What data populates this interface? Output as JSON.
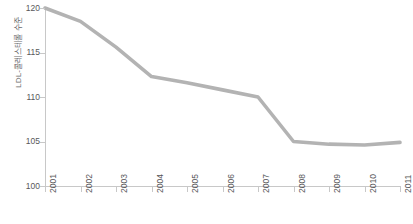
{
  "chart_data": {
    "type": "line",
    "title": "",
    "xlabel": "",
    "ylabel": "LDL-콜레스테롤 수준",
    "categories": [
      "2001",
      "2002",
      "2003",
      "2004",
      "2005",
      "2006",
      "2007",
      "2008",
      "2009",
      "2010",
      "2011"
    ],
    "values": [
      120.0,
      118.5,
      115.6,
      112.3,
      111.6,
      110.8,
      110.0,
      105.0,
      104.7,
      104.6,
      104.9
    ],
    "series": [
      {
        "name": "LDL-콜레스테롤 수준",
        "values": [
          120.0,
          118.5,
          115.6,
          112.3,
          111.6,
          110.8,
          110.0,
          105.0,
          104.7,
          104.6,
          104.9
        ]
      }
    ],
    "ylim": [
      100,
      120
    ],
    "y_ticks": [
      100,
      105,
      110,
      115,
      120
    ],
    "y_tick_labels": [
      "100",
      "105",
      "110",
      "115",
      "120"
    ],
    "x_ticks": [
      "2001",
      "2002",
      "2003",
      "2004",
      "2005",
      "2006",
      "2007",
      "2008",
      "2009",
      "2010",
      "2011"
    ],
    "grid": false,
    "legend": false,
    "legend_position": "none",
    "line_color": "#b3b3b3",
    "axis_color": "#c8c8c8",
    "text_color": "#58585a",
    "background_color": "#ffffff",
    "watermark": ""
  }
}
